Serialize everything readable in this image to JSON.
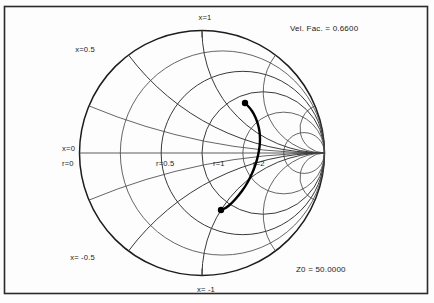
{
  "figure": {
    "kind": "smith-chart",
    "width": 434,
    "height": 303,
    "background": "#fdfdfd",
    "frame_color": "#2a2a2a"
  },
  "annotations": {
    "velocity_factor": "Vel. Fac. = 0.6600",
    "reference_impedance": "Z0 = 50.0000"
  },
  "axis_labels": {
    "x_zero": "x=0",
    "r_zero": "r=0",
    "r_half": "r=0.5",
    "r_one": "r=1",
    "r_two": "r=2",
    "x_half": "x=0.5",
    "x_one": "x=1",
    "x_neg_half": "x= -0.5",
    "x_neg_one": "x= -1"
  },
  "chart_data": {
    "type": "line",
    "coordinate_system": "reflection-coefficient",
    "normalization": 50.0,
    "velocity_factor": 0.66,
    "xlabel": "",
    "ylabel": "",
    "xlim": [
      -1,
      1
    ],
    "ylim": [
      -1,
      1
    ],
    "grid": true,
    "legend": "none",
    "center": [
      202,
      153
    ],
    "radius": 122.5,
    "resistance_circles": [
      0,
      0.2,
      0.5,
      1,
      2,
      5
    ],
    "labeled_resistance_circles": [
      {
        "value": 0,
        "label": "r=0"
      },
      {
        "value": 0.5,
        "label": "r=0.5"
      },
      {
        "value": 1,
        "label": "r=1"
      },
      {
        "value": 2,
        "label": "r=2"
      }
    ],
    "reactance_arcs": [
      0.2,
      0.5,
      1,
      2,
      5,
      -0.2,
      -0.5,
      -1,
      -2,
      -5
    ],
    "labeled_reactance_arcs": [
      {
        "value": 0,
        "label": "x=0"
      },
      {
        "value": 0.5,
        "label": "x=0.5"
      },
      {
        "value": 1,
        "label": "x=1"
      },
      {
        "value": -0.5,
        "label": "x= -0.5"
      },
      {
        "value": -1,
        "label": "x= -1"
      }
    ],
    "trace": {
      "name": "impedance-locus",
      "stroke": "#000000",
      "marker_start": {
        "gamma_re": 0.35,
        "gamma_im": 0.41,
        "px": [
          245,
          103
        ]
      },
      "marker_end": {
        "gamma_re": 0.155,
        "gamma_im": -0.465,
        "px": [
          221,
          210
        ]
      },
      "points_px": [
        [
          245,
          103
        ],
        [
          250,
          108
        ],
        [
          254,
          114
        ],
        [
          257,
          121
        ],
        [
          259,
          128
        ],
        [
          260,
          135
        ],
        [
          260,
          143
        ],
        [
          259,
          151
        ],
        [
          257,
          160
        ],
        [
          254,
          169
        ],
        [
          250,
          178
        ],
        [
          245,
          187
        ],
        [
          239,
          195
        ],
        [
          232,
          203
        ],
        [
          226,
          208
        ],
        [
          221,
          210
        ]
      ]
    }
  }
}
